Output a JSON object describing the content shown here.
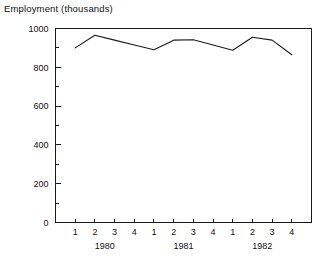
{
  "chart_data": {
    "type": "line",
    "title": "Employment (thousands)",
    "xlabel": "",
    "ylabel": "",
    "ylim": [
      0,
      1000
    ],
    "grid": false,
    "legend": null,
    "y_ticks": [
      0,
      200,
      400,
      600,
      800,
      1000
    ],
    "y_tick_labels": [
      "0",
      "200",
      "400",
      "600",
      "800",
      "1000"
    ],
    "y_minor_ticks": [
      100,
      300,
      500,
      700,
      900
    ],
    "x_tick_labels": [
      "1",
      "2",
      "3",
      "4",
      "1",
      "2",
      "3",
      "4",
      "1",
      "2",
      "3",
      "4"
    ],
    "x_group_labels": [
      "1980",
      "1981",
      "1982"
    ],
    "categories": [
      "1980 Q1",
      "1980 Q2",
      "1980 Q3",
      "1980 Q4",
      "1981 Q1",
      "1981 Q2",
      "1981 Q3",
      "1981 Q4",
      "1982 Q1",
      "1982 Q2",
      "1982 Q3",
      "1982 Q4"
    ],
    "values": [
      900,
      965,
      940,
      915,
      890,
      940,
      942,
      915,
      888,
      955,
      940,
      865
    ],
    "line_color": "#1a1a1a",
    "axis_color": "#1a1a1a",
    "background_color": "#ffffff"
  }
}
